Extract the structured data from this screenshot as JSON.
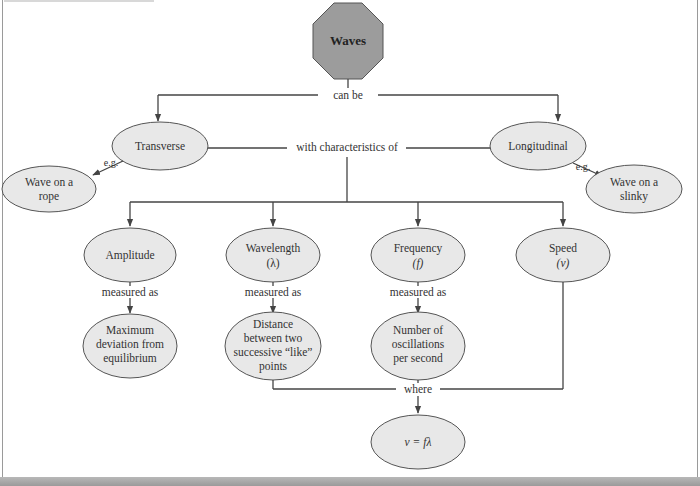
{
  "diagram": {
    "root": {
      "label": "Waves",
      "shape": "octagon",
      "fill": "#9c9c9c"
    },
    "link_labels": {
      "can_be": "can be",
      "with_characteristics_of": "with characteristics of",
      "eg_transverse": "e.g.",
      "eg_longitudinal": "e.g.",
      "measured_as_amplitude": "measured as",
      "measured_as_wavelength": "measured as",
      "measured_as_frequency": "measured as",
      "where": "where"
    },
    "types": [
      {
        "label": "Transverse",
        "example": [
          "Wave on a",
          "rope"
        ]
      },
      {
        "label": "Longitudinal",
        "example": [
          "Wave on a",
          "slinky"
        ]
      }
    ],
    "characteristics": [
      {
        "label": "Amplitude",
        "symbol": "",
        "measured": [
          "Maximum",
          "deviation from",
          "equilibrium"
        ]
      },
      {
        "label": "Wavelength",
        "symbol": "(λ)",
        "measured": [
          "Distance",
          "between two",
          "successive “like”",
          "points"
        ]
      },
      {
        "label": "Frequency",
        "symbol": "(f)",
        "measured": [
          "Number of",
          "oscillations",
          "per second"
        ]
      },
      {
        "label": "Speed",
        "symbol": "(v)",
        "measured": []
      }
    ],
    "equation": "v = fλ",
    "colors": {
      "node_fill": "#e8e8e8",
      "stroke": "#555555",
      "line": "#444444"
    }
  }
}
